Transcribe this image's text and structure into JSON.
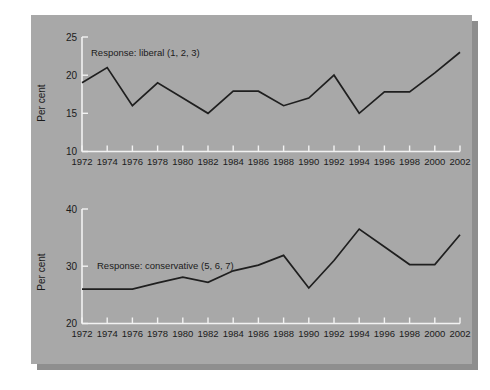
{
  "figure": {
    "background": "#ffffff",
    "panel_color": "#a8a8a8",
    "shadow_color": "#8e8e8e",
    "axis_color": "#f2f2f2",
    "line_color": "#1f1f1f"
  },
  "chart_data": [
    {
      "type": "line",
      "title": "",
      "xlabel": "",
      "ylabel": "Per cent",
      "annotation": "Response: liberal (1, 2, 3)",
      "grid": false,
      "legend": "none",
      "xlim": [
        1972,
        2002
      ],
      "ylim": [
        10,
        25
      ],
      "yticks": [
        10,
        15,
        20,
        25
      ],
      "ytick_labels": [
        "10",
        "15",
        "20",
        "25"
      ],
      "categories": [
        1972,
        1974,
        1976,
        1978,
        1980,
        1982,
        1984,
        1986,
        1988,
        1990,
        1992,
        1994,
        1996,
        1998,
        2000,
        2002
      ],
      "xtick_labels": [
        "1972",
        "1974",
        "1976",
        "1978",
        "1980",
        "1982",
        "1984",
        "1986",
        "1988",
        "1990",
        "1992",
        "1994",
        "1996",
        "1998",
        "2000",
        "2002"
      ],
      "values": [
        19.0,
        21.0,
        16.0,
        19.0,
        17.0,
        15.0,
        17.9,
        17.9,
        16.0,
        17.0,
        20.0,
        15.0,
        17.8,
        17.8,
        20.3,
        23.0
      ]
    },
    {
      "type": "line",
      "title": "",
      "xlabel": "",
      "ylabel": "Per cent",
      "annotation": "Response: conservative (5, 6, 7)",
      "grid": false,
      "legend": "none",
      "xlim": [
        1972,
        2002
      ],
      "ylim": [
        20,
        40
      ],
      "yticks": [
        20,
        30,
        40
      ],
      "ytick_labels": [
        "20",
        "30",
        "40"
      ],
      "categories": [
        1972,
        1974,
        1976,
        1978,
        1980,
        1982,
        1984,
        1986,
        1988,
        1990,
        1992,
        1994,
        1996,
        1998,
        2000,
        2002
      ],
      "xtick_labels": [
        "1972",
        "1974",
        "1976",
        "1978",
        "1980",
        "1982",
        "1984",
        "1986",
        "1988",
        "1990",
        "1992",
        "1994",
        "1996",
        "1998",
        "2000",
        "2002"
      ],
      "values": [
        26.0,
        26.0,
        26.0,
        27.1,
        28.1,
        27.2,
        29.2,
        30.2,
        31.9,
        26.2,
        31.0,
        36.5,
        33.4,
        30.3,
        30.3,
        35.5
      ]
    }
  ]
}
